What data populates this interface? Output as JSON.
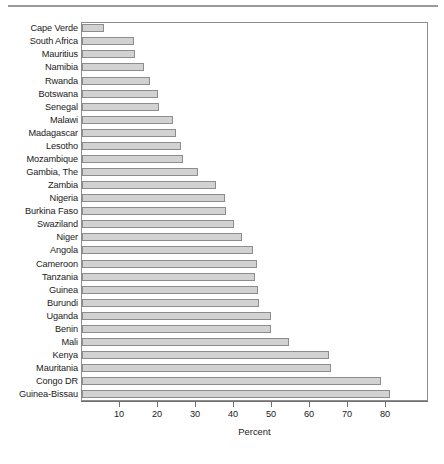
{
  "chart_data": {
    "type": "bar",
    "orientation": "horizontal",
    "title": "",
    "xlabel": "Percent",
    "ylabel": "",
    "xlim": [
      0,
      91
    ],
    "grid": false,
    "legend": null,
    "xticks": [
      10,
      20,
      30,
      40,
      50,
      60,
      70,
      80
    ],
    "xticklabels": [
      "10",
      "20",
      "30",
      "40",
      "50",
      "60",
      "70",
      "80"
    ],
    "categories": [
      "Cape Verde",
      "South Africa",
      "Mauritius",
      "Namibia",
      "Rwanda",
      "Botswana",
      "Senegal",
      "Malawi",
      "Madagascar",
      "Lesotho",
      "Mozambique",
      "Gambia, The",
      "Zambia",
      "Nigeria",
      "Burkina Faso",
      "Swaziland",
      "Niger",
      "Angola",
      "Cameroon",
      "Tanzania",
      "Guinea",
      "Burundi",
      "Uganda",
      "Benin",
      "Mali",
      "Kenya",
      "Mauritania",
      "Congo DR",
      "Guinea-Bissau"
    ],
    "values": [
      5.8,
      13.7,
      14.0,
      16.3,
      18.0,
      20.0,
      20.3,
      24.0,
      24.7,
      26.0,
      26.6,
      30.5,
      35.3,
      37.6,
      37.9,
      40.0,
      42.0,
      45.0,
      46.0,
      45.5,
      46.3,
      46.6,
      49.7,
      49.7,
      54.5,
      65.0,
      65.5,
      78.7,
      81.0
    ]
  },
  "colors": {
    "bar_fill": "#d2d2d2",
    "bar_border": "#8d8d8d",
    "axis": "#6f6f6f",
    "text": "#1a1a1a",
    "rule": "#9a9a9a"
  },
  "footer": {
    "sliver_text": ""
  }
}
